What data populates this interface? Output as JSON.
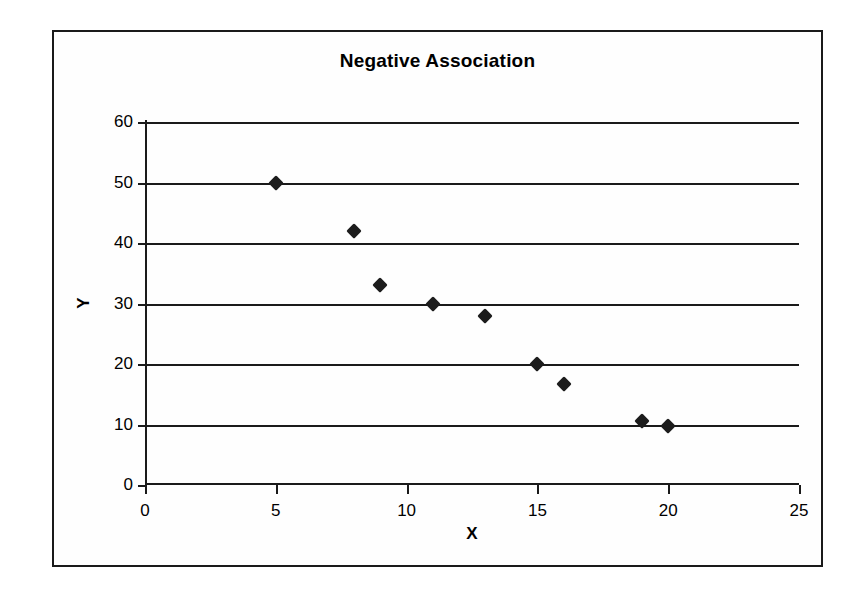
{
  "chart_data": {
    "type": "scatter",
    "title": "Negative Association",
    "xlabel": "X",
    "ylabel": "Y",
    "xlim": [
      0,
      25
    ],
    "ylim": [
      0,
      60
    ],
    "xticks": [
      0,
      5,
      10,
      15,
      20,
      25
    ],
    "yticks": [
      0,
      10,
      20,
      30,
      40,
      50,
      60
    ],
    "grid": "horizontal",
    "legend": "none",
    "marker": "diamond",
    "marker_color": "#1c1c1c",
    "points": [
      {
        "x": 5,
        "y": 50
      },
      {
        "x": 8,
        "y": 42
      },
      {
        "x": 9,
        "y": 33
      },
      {
        "x": 11,
        "y": 30
      },
      {
        "x": 13,
        "y": 28
      },
      {
        "x": 15,
        "y": 20
      },
      {
        "x": 16,
        "y": 16.7
      },
      {
        "x": 19,
        "y": 10.6
      },
      {
        "x": 20,
        "y": 9.8
      }
    ],
    "series": [
      {
        "name": "Series 1",
        "x": [
          5,
          8,
          9,
          11,
          13,
          15,
          16,
          19,
          20
        ],
        "values": [
          50,
          42,
          33,
          30,
          28,
          20,
          16.7,
          10.6,
          9.8
        ]
      }
    ]
  },
  "frame": {
    "border_color": "#1a1a1a",
    "background": "#fefefe"
  }
}
